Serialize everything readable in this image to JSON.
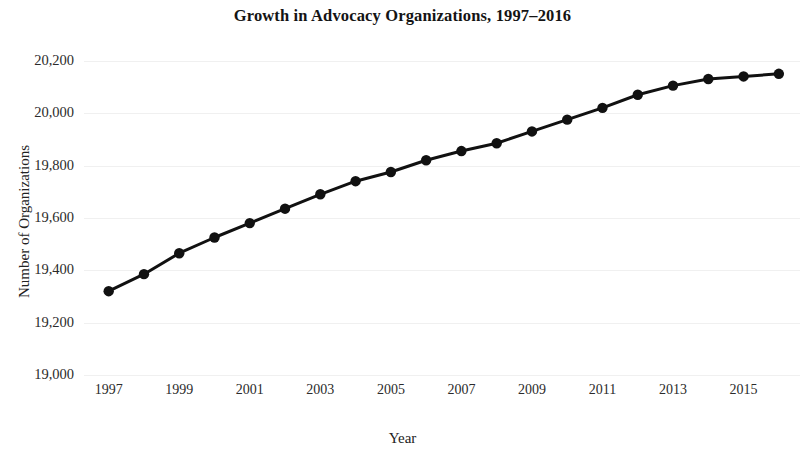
{
  "chart_data": {
    "type": "line",
    "title": "Growth in Advocacy Organizations, 1997–2016",
    "xlabel": "Year",
    "ylabel": "Number of Organizations",
    "x": [
      1997,
      1998,
      1999,
      2000,
      2001,
      2002,
      2003,
      2004,
      2005,
      2006,
      2007,
      2008,
      2009,
      2010,
      2011,
      2012,
      2013,
      2014,
      2015,
      2016
    ],
    "values": [
      19320,
      19385,
      19465,
      19525,
      19580,
      19635,
      19690,
      19740,
      19775,
      19820,
      19855,
      19885,
      19930,
      19975,
      20020,
      20070,
      20105,
      20130,
      20140,
      20150
    ],
    "series": [
      {
        "name": "Number of Organizations",
        "values": [
          19320,
          19385,
          19465,
          19525,
          19580,
          19635,
          19690,
          19740,
          19775,
          19820,
          19855,
          19885,
          19930,
          19975,
          20020,
          20070,
          20105,
          20130,
          20140,
          20150
        ]
      }
    ],
    "xlim": [
      1996.3,
      2016.6
    ],
    "ylim": [
      19000,
      20260
    ],
    "ytick_values": [
      20200,
      20000,
      19800,
      19600,
      19400,
      19200,
      19000
    ],
    "ytick_labels": [
      "20,200",
      "20,000",
      "19,800",
      "19,600",
      "19,400",
      "19,200",
      "19,000"
    ],
    "xtick_values": [
      1997,
      1999,
      2001,
      2003,
      2005,
      2007,
      2009,
      2011,
      2013,
      2015
    ],
    "xtick_labels": [
      "1997",
      "1999",
      "2001",
      "2003",
      "2005",
      "2007",
      "2009",
      "2011",
      "2013",
      "2015"
    ],
    "grid": "horizontal",
    "legend": "none",
    "line_color": "#111111",
    "marker_color": "#111111",
    "grid_color": "#f0f0f0",
    "background_color": "#ffffff",
    "line_width": 3,
    "marker_size": 5.2
  }
}
